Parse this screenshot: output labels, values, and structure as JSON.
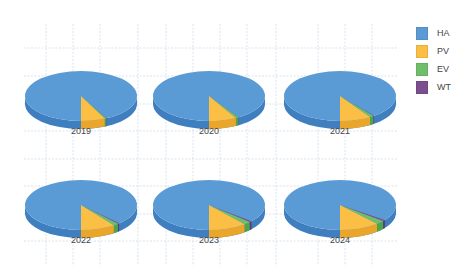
{
  "chart_data": {
    "type": "pie",
    "variant": "3d-pie-small-multiples",
    "title": "",
    "legend": {
      "position": "right",
      "entries": [
        {
          "label": "HA",
          "color": "#5b9bd5"
        },
        {
          "label": "PV",
          "color": "#fbbf46"
        },
        {
          "label": "EV",
          "color": "#6fbf6a"
        },
        {
          "label": "WT",
          "color": "#7b4f8e"
        }
      ]
    },
    "categories": [
      "HA",
      "PV",
      "EV",
      "WT"
    ],
    "grid": true,
    "charts": [
      {
        "label": "2019",
        "values": {
          "HA": 92.4,
          "PV": 7.0,
          "EV": 0.5,
          "WT": 0.1
        }
      },
      {
        "label": "2020",
        "values": {
          "HA": 91.1,
          "PV": 8.0,
          "EV": 0.8,
          "WT": 0.1
        }
      },
      {
        "label": "2021",
        "values": {
          "HA": 89.6,
          "PV": 9.0,
          "EV": 1.2,
          "WT": 0.2
        }
      },
      {
        "label": "2022",
        "values": {
          "HA": 88.1,
          "PV": 10.0,
          "EV": 1.5,
          "WT": 0.4
        }
      },
      {
        "label": "2023",
        "values": {
          "HA": 86.3,
          "PV": 11.0,
          "EV": 2.0,
          "WT": 0.7
        }
      },
      {
        "label": "2024",
        "values": {
          "HA": 85.2,
          "PV": 11.5,
          "EV": 2.5,
          "WT": 0.8
        }
      }
    ]
  },
  "legend": {
    "items": [
      {
        "label": "HA",
        "color": "#5b9bd5"
      },
      {
        "label": "PV",
        "color": "#fbbf46"
      },
      {
        "label": "EV",
        "color": "#6fbf6a"
      },
      {
        "label": "WT",
        "color": "#7b4f8e"
      }
    ]
  }
}
